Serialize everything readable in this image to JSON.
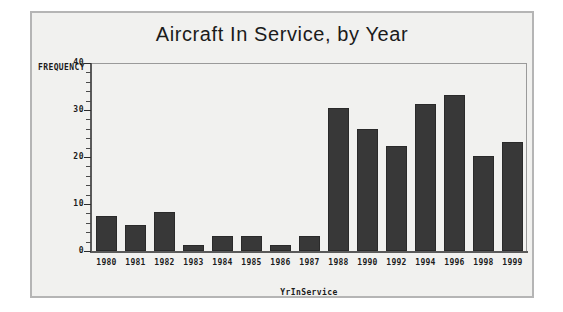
{
  "figure": {
    "background_color": "#f1f1ef",
    "frame_color": "#b5b5b5",
    "bar_color": "#383838",
    "axis_color": "#5a5a5a",
    "text_color": "#1b1b1b"
  },
  "chart_data": {
    "type": "bar",
    "title": "Aircraft In Service, by Year",
    "xlabel": "YrInService",
    "ylabel": "FREQUENCY",
    "categories": [
      "1980",
      "1981",
      "1982",
      "1983",
      "1984",
      "1985",
      "1986",
      "1987",
      "1988",
      "1990",
      "1992",
      "1994",
      "1996",
      "1998",
      "1999"
    ],
    "values": [
      7.5,
      5.5,
      8.3,
      1.3,
      3.3,
      3.3,
      1.2,
      3.3,
      30.5,
      26,
      22.3,
      31.3,
      33.3,
      20.3,
      23.3
    ],
    "ylim": [
      0,
      40
    ],
    "yticks": [
      0,
      10,
      20,
      30,
      40
    ],
    "ytick_labels": [
      "0",
      "10",
      "20",
      "30",
      "40"
    ],
    "y_minor_tick_interval": 2,
    "grid": false,
    "legend": false,
    "legend_position": "none"
  }
}
